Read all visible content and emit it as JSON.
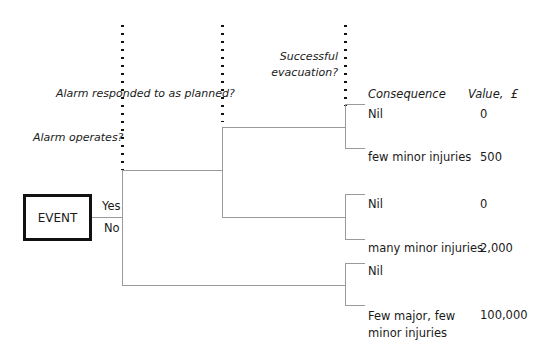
{
  "diagram": {
    "type": "event-tree",
    "initiating_event": "EVENT",
    "branch_labels": {
      "yes": "Yes",
      "no": "No"
    },
    "questions": [
      {
        "id": "q1",
        "text": "Alarm operates?"
      },
      {
        "id": "q2",
        "text": "Alarm responded to as planned?"
      },
      {
        "id": "q3",
        "text_line1": "Successful",
        "text_line2": "evacuation?"
      }
    ],
    "headers": {
      "consequence": "Consequence",
      "value": "Value,  £"
    },
    "outcomes": [
      {
        "consequence": "Nil",
        "value": "0"
      },
      {
        "consequence": "few minor injuries",
        "value": "500"
      },
      {
        "consequence": "Nil",
        "value": "0"
      },
      {
        "consequence": "many minor injuries",
        "value": "2,000"
      },
      {
        "consequence": "Nil",
        "value": ""
      },
      {
        "consequence_line1": "Few major, few",
        "consequence_line2": "minor injuries",
        "value": "100,000"
      }
    ],
    "colors": {
      "line": "#9a9a9a",
      "dots": "#111111",
      "box_border": "#111111"
    }
  }
}
